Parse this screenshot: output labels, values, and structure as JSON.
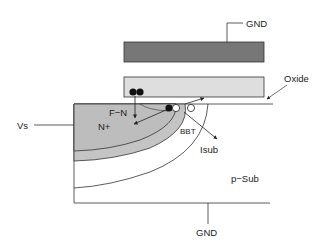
{
  "diagram": {
    "labels": {
      "gnd_top": "GND",
      "gnd_bottom": "GND",
      "oxide": "Oxide",
      "vs": "Vs",
      "fn": "F−N",
      "n_plus": "N+",
      "bbt": "BBT",
      "isub": "Isub",
      "p_sub": "p−Sub"
    },
    "regions": {
      "control_gate": {
        "name": "control gate",
        "fill": "#777777"
      },
      "floating_gate": {
        "name": "floating gate",
        "fill": "#dedede"
      },
      "n_plus_region": {
        "name": "N+ source",
        "fill": "#bdbdbd"
      },
      "depletion_region": {
        "name": "depletion layer",
        "fill": "#c9c9c9"
      },
      "substrate": {
        "name": "p-substrate",
        "fill": "#ffffff"
      }
    },
    "carriers": {
      "electrons": 3,
      "holes": 2
    }
  }
}
